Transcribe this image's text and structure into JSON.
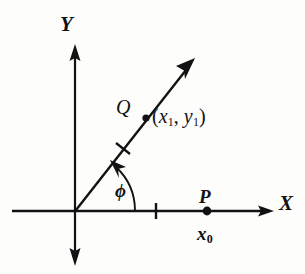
{
  "figure": {
    "type": "coordinate-diagram",
    "background_color": "#fdfdfc",
    "ink_color": "#121212"
  },
  "axes": {
    "x": {
      "label": "X",
      "label_style": "bold-italic",
      "arrow": "right",
      "origin_px": [
        75,
        211
      ],
      "start_px": [
        12,
        211
      ],
      "end_px": [
        272,
        211
      ]
    },
    "y": {
      "label": "Y",
      "label_style": "bold-italic",
      "arrow": "both",
      "top_px": [
        75,
        46
      ],
      "bottom_px": [
        75,
        262
      ]
    }
  },
  "ray": {
    "from_px": [
      75,
      211
    ],
    "to_px": [
      193,
      61
    ],
    "arrow": "end",
    "angle_label": "ϕ",
    "angle_label_name": "phi",
    "tick_marks": 1
  },
  "ticks": {
    "x_axis": [
      {
        "position_px": 156,
        "label": ""
      }
    ],
    "ray": [
      {
        "position_px": [
          123,
          150
        ]
      }
    ]
  },
  "points": [
    {
      "name": "Q",
      "label": "Q",
      "coordinate_label": "(x₁, y₁)",
      "coordinate_parts": {
        "open": "(",
        "x_var": "x",
        "x_sub": "1",
        "comma": ",",
        "y_var": "y",
        "y_sub": "1",
        "close": ")"
      },
      "dot_px": [
        146,
        118
      ],
      "on": "ray"
    },
    {
      "name": "P",
      "label": "P",
      "coordinate_label": "x₀",
      "coordinate_parts": {
        "var": "x",
        "sub": "0"
      },
      "dot_px": [
        207,
        211
      ],
      "on": "x-axis"
    }
  ],
  "labels": {
    "y_axis": "Y",
    "x_axis": "X",
    "q_point": "Q",
    "p_point": "P",
    "phi": "ϕ"
  }
}
